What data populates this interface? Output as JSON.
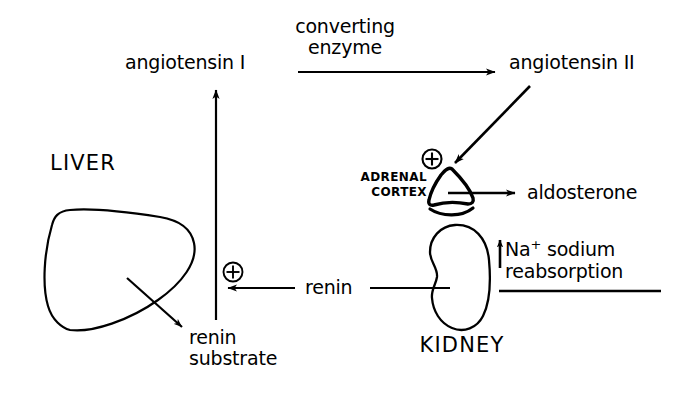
{
  "diagram": {
    "background_color": "#ffffff",
    "ink_color": "#000000",
    "nodes": {
      "angiotensin_1": "angiotensin I",
      "angiotensin_2": "angiotensin II",
      "converting_enzyme": "converting\nenzyme",
      "liver": "LIVER",
      "renin_substrate": "renin\nsubstrate",
      "renin": "renin",
      "kidney": "KIDNEY",
      "adrenal_cortex": "ADRENAL\nCORTEX",
      "aldosterone": "aldosterone",
      "sodium_reabsorption_line1_prefix": "Na",
      "sodium_reabsorption_line1_sup": "+",
      "sodium_reabsorption_line1_suffix": " sodium",
      "sodium_reabsorption_line2": "reabsorption",
      "plus_adrenal": "+",
      "plus_renin": "+"
    },
    "organ_shapes": {
      "liver_shape": "liver-outline",
      "kidney_shape": "kidney-bean-outline",
      "adrenal_shape": "adrenal-cap-outline"
    },
    "arrows": [
      {
        "name": "angiotensin1-to-angiotensin2",
        "label": "converting enzyme"
      },
      {
        "name": "angiotensin2-to-adrenal-cortex",
        "label": ""
      },
      {
        "name": "adrenal-cortex-to-aldosterone",
        "label": "aldosterone"
      },
      {
        "name": "kidney-to-renin",
        "label": "renin"
      },
      {
        "name": "renin-to-renin-substrate-stimulation",
        "label": "+"
      },
      {
        "name": "renin-substrate-to-angiotensin1",
        "label": ""
      },
      {
        "name": "liver-to-renin-substrate",
        "label": ""
      },
      {
        "name": "sodium-reabsorption-up-arrow",
        "label": "Na+ sodium reabsorption"
      }
    ]
  }
}
